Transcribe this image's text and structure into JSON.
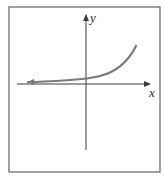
{
  "figure": {
    "axes": {
      "x_label": "x",
      "y_label": "y"
    },
    "curve": {
      "type": "exponential-growth",
      "left_end": "arrow",
      "color": "#7a7a7a"
    },
    "colors": {
      "frame": "#6e6e6e",
      "axis": "#3a3a3a",
      "background": "#ffffff"
    }
  }
}
